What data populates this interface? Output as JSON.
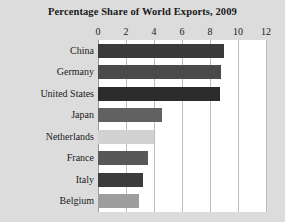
{
  "chart_data": {
    "type": "bar",
    "orientation": "horizontal",
    "title": "Percentage Share of World Exports, 2009",
    "xlabel": "",
    "ylabel": "",
    "xlim": [
      0,
      12
    ],
    "xticks": [
      0,
      2,
      4,
      6,
      8,
      10,
      12
    ],
    "xtick_labels": [
      "0",
      "2",
      "4",
      "6",
      "8",
      "10",
      "12"
    ],
    "grid": true,
    "grid_axis": "x",
    "legend": false,
    "categories": [
      "China",
      "Germany",
      "United States",
      "Japan",
      "Netherlands",
      "France",
      "Italy",
      "Belgium"
    ],
    "values": [
      9.0,
      8.8,
      8.7,
      4.6,
      4.0,
      3.6,
      3.2,
      2.9
    ],
    "bar_colors": [
      "#3a3a3a",
      "#4a4a4a",
      "#2b2b2b",
      "#616161",
      "#d2d2d2",
      "#585858",
      "#3c3c3c",
      "#9d9d9d"
    ]
  },
  "figure": {
    "background_color": "#dcdcdc",
    "plot_background_color": "#ffffff",
    "gridline_color": "#bdbdbd",
    "text_color": "#1a1a1a"
  }
}
